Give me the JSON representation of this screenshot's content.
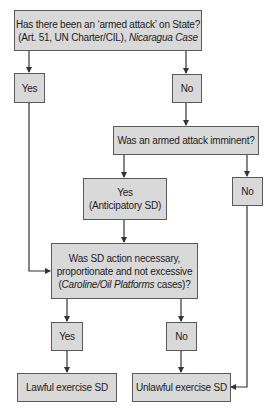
{
  "flowchart": {
    "q1": {
      "line1": "Has there been an ‘armed attack’ on State?",
      "line2_pre": "(Art. 51, UN Charter/CIL), ",
      "line2_italic": "Nicaragua Case"
    },
    "q1_yes": "Yes",
    "q1_no": "No",
    "q2": "Was an armed attack imminent?",
    "q2_yes_line1": "Yes",
    "q2_yes_line2": "(Anticipatory SD)",
    "q2_no": "No",
    "q3": {
      "line1": "Was SD action necessary,",
      "line2": "proportionate and not excessive",
      "line3_pre": "(",
      "line3_italic": "Caroline/Oil Platforms",
      "line3_post": " cases)?"
    },
    "q3_yes": "Yes",
    "q3_no": "No",
    "outcome_lawful": "Lawful exercise SD",
    "outcome_unlawful": "Unlawful exercise SD"
  }
}
